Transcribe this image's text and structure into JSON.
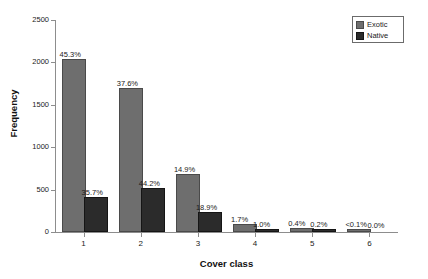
{
  "chart_data": {
    "type": "bar",
    "title": "",
    "xlabel": "Cover class",
    "ylabel": "Frequency",
    "categories": [
      "1",
      "2",
      "3",
      "4",
      "5",
      "6"
    ],
    "ylim": [
      0,
      2500
    ],
    "yticks": [
      0,
      500,
      1000,
      1500,
      2000,
      2500
    ],
    "ytick_labels": [
      "0",
      "500",
      "1000",
      "1500",
      "2000",
      "2500"
    ],
    "grid": false,
    "legend_position": "top-right",
    "series": [
      {
        "name": "Exotic",
        "color": "#6e6e6e",
        "values": [
          2020,
          1680,
          665,
          75,
          18,
          2
        ],
        "data_labels": [
          "45.3%",
          "37.6%",
          "14.9%",
          "1.7%",
          "0.4%",
          "<0.1%"
        ]
      },
      {
        "name": "Native",
        "color": "#2b2b2b",
        "values": [
          395,
          490,
          210,
          11,
          2,
          0
        ],
        "data_labels": [
          "35.7%",
          "44.2%",
          "18.9%",
          "1.0%",
          "0.2%",
          "0.0%"
        ]
      }
    ]
  },
  "legend": {
    "entries": [
      {
        "label": "Exotic"
      },
      {
        "label": "Native"
      }
    ]
  }
}
